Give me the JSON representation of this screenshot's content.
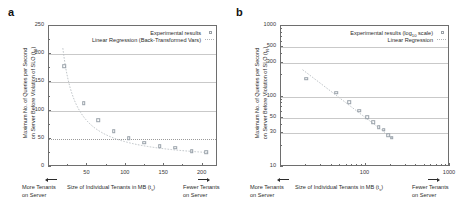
{
  "figure": {
    "panels": [
      {
        "label": "a",
        "legend": [
          {
            "text": "Experimental results",
            "marker": "open-square"
          },
          {
            "text": "Linear Regression (Back-Transformed Vars)",
            "marker": "dotted-line"
          }
        ],
        "ylabel_line1": "Maximum No. of Queries per Second",
        "ylabel_line2": "on Server Before Violation of SLO (t",
        "ylabel_sub": "R",
        "ylabel_end": ")",
        "xlabel_main": "Size of Individual Tenants in MB (t",
        "xlabel_sub": "s",
        "xlabel_end": ")",
        "left_note_line1": "More Tenants",
        "left_note_line2": "on Server",
        "right_note_line1": "Fewer Tenants",
        "right_note_line2": "on Server",
        "yticks": [
          "0",
          "50",
          "100",
          "150",
          "200",
          "250"
        ],
        "xticks": [
          "50",
          "100",
          "150",
          "200"
        ]
      },
      {
        "label": "b",
        "legend": [
          {
            "text": "Experimental results (log",
            "sub": "10",
            "text_end": " scale)",
            "marker": "open-square"
          },
          {
            "text": "Linear Regression",
            "marker": "dotted-line"
          }
        ],
        "ylabel_line1": "Maximum No. of Queries per Second",
        "ylabel_line2": "on Server Before Violation of SLO (t",
        "ylabel_sub": "R",
        "ylabel_end": ")",
        "xlabel_main": "Size of Individual Tenants in MB (t",
        "xlabel_sub": "s",
        "xlabel_end": ")",
        "left_note_line1": "More Tenants",
        "left_note_line2": "on Server",
        "right_note_line1": "Fewer Tenants",
        "right_note_line2": "on Server",
        "yticks": [
          "10",
          "30",
          "50",
          "100",
          "300",
          "500",
          "1000"
        ],
        "xticks": [
          "100",
          "1000"
        ]
      }
    ]
  },
  "chart_data": [
    {
      "type": "scatter",
      "panel": "a",
      "title": "",
      "xlabel": "Size of Individual Tenants in MB (t_s)",
      "ylabel": "Maximum No. of Queries per Second on Server Before Violation of SLO (t_R)",
      "xscale": "linear",
      "yscale": "linear",
      "xlim": [
        0,
        220
      ],
      "ylim": [
        0,
        250
      ],
      "xticks": [
        50,
        100,
        150,
        200
      ],
      "yticks": [
        0,
        50,
        100,
        150,
        200,
        250
      ],
      "grid": true,
      "legend_position": "top-right",
      "series": [
        {
          "name": "Experimental results",
          "marker": "open-square",
          "x": [
            20,
            45,
            64,
            84,
            104,
            124,
            144,
            164,
            186,
            205
          ],
          "y": [
            179,
            113,
            83,
            63,
            51,
            43,
            37,
            34,
            28,
            26
          ]
        },
        {
          "name": "Linear Regression (Back-Transformed Vars)",
          "style": "dotted",
          "x": [
            20,
            45,
            64,
            84,
            104,
            124,
            144,
            164,
            186,
            205
          ],
          "y": [
            182,
            112,
            84,
            64,
            52,
            44,
            38,
            33,
            29,
            26
          ]
        }
      ]
    },
    {
      "type": "scatter",
      "panel": "b",
      "title": "",
      "xlabel": "Size of Individual Tenants in MB (t_s)",
      "ylabel": "Maximum No. of Queries per Second on Server Before Violation of SLO (t_R)",
      "xscale": "log10",
      "yscale": "log10",
      "xlim": [
        10,
        1000
      ],
      "ylim": [
        10,
        1000
      ],
      "xticks": [
        100,
        1000
      ],
      "yticks": [
        10,
        30,
        50,
        100,
        300,
        500,
        1000
      ],
      "grid": true,
      "legend_position": "top-right",
      "series": [
        {
          "name": "Experimental results (log10 scale)",
          "marker": "open-square",
          "x": [
            20,
            45,
            64,
            84,
            104,
            124,
            144,
            164,
            186,
            205
          ],
          "y": [
            179,
            113,
            83,
            63,
            51,
            43,
            37,
            34,
            28,
            26
          ]
        },
        {
          "name": "Linear Regression",
          "style": "dotted",
          "x": [
            18,
            205
          ],
          "y": [
            240,
            26
          ]
        }
      ]
    }
  ]
}
